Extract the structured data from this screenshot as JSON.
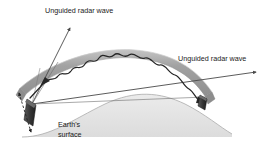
{
  "figure": {
    "labels": {
      "unguided_wave_left": "Unguided radar wave",
      "unguided_wave_right": "Unguided radar wave",
      "earth_line1": "Earth's",
      "earth_line2": "surface"
    },
    "colors": {
      "background": "#ffffff",
      "duct_band": "#9a9a9a",
      "duct_band_edge": "#c4c4c4",
      "earth_fill": "#e2e2e2",
      "earth_outline": "#b0b0b0",
      "ray_stroke": "#4a4a4a",
      "wave_stroke": "#2a2a2a",
      "antenna_fill": "#3d3d3d",
      "text": "#1a1a1a"
    },
    "elements": {
      "transmitter_antenna": "transmitter-antenna",
      "receiver_antenna": "receiver-antenna",
      "beamwidth_arrow": "beamwidth-double-arrow",
      "duct_band": "atmospheric-duct-band",
      "guided_wave": "guided-radar-wave",
      "ray_upper": "unguided-ray-upper-left",
      "ray_lower": "unguided-ray-lower-right",
      "earth_dome": "earth-surface-dome"
    }
  }
}
